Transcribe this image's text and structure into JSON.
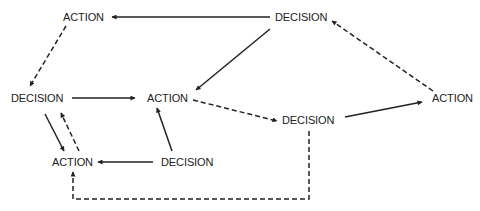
{
  "diagram": {
    "type": "flow-diagram",
    "colors": {
      "line": "#222222",
      "text": "#222222",
      "background": "#ffffff"
    },
    "nodes": [
      {
        "id": "action_top_left",
        "label": "ACTION",
        "x": 63,
        "y": 11
      },
      {
        "id": "decision_top_right",
        "label": "DECISION",
        "x": 275,
        "y": 11
      },
      {
        "id": "decision_left",
        "label": "DECISION",
        "x": 11,
        "y": 92
      },
      {
        "id": "action_center",
        "label": "ACTION",
        "x": 147,
        "y": 92
      },
      {
        "id": "decision_center_right",
        "label": "DECISION",
        "x": 282,
        "y": 114
      },
      {
        "id": "action_right",
        "label": "ACTION",
        "x": 432,
        "y": 92
      },
      {
        "id": "action_bottom_left",
        "label": "ACTION",
        "x": 52,
        "y": 156
      },
      {
        "id": "decision_bottom_center",
        "label": "DECISION",
        "x": 161,
        "y": 156
      }
    ],
    "edges": [
      {
        "from": "decision_top_right",
        "to": "action_top_left",
        "style": "solid"
      },
      {
        "from": "decision_top_right",
        "to": "action_center",
        "style": "solid"
      },
      {
        "from": "action_top_left",
        "to": "decision_left",
        "style": "dashed"
      },
      {
        "from": "decision_left",
        "to": "action_center",
        "style": "solid"
      },
      {
        "from": "action_center",
        "to": "decision_center_right",
        "style": "dashed"
      },
      {
        "from": "decision_center_right",
        "to": "action_right",
        "style": "solid"
      },
      {
        "from": "action_right",
        "to": "decision_top_right",
        "style": "dashed"
      },
      {
        "from": "decision_left",
        "to": "action_bottom_left",
        "style": "solid"
      },
      {
        "from": "action_bottom_left",
        "to": "decision_left",
        "style": "dashed"
      },
      {
        "from": "decision_bottom_center",
        "to": "action_bottom_left",
        "style": "solid"
      },
      {
        "from": "decision_bottom_center",
        "to": "action_center",
        "style": "solid"
      },
      {
        "from": "decision_center_right",
        "to": "action_bottom_left",
        "style": "dashed",
        "routing": "down-left-up"
      }
    ]
  }
}
